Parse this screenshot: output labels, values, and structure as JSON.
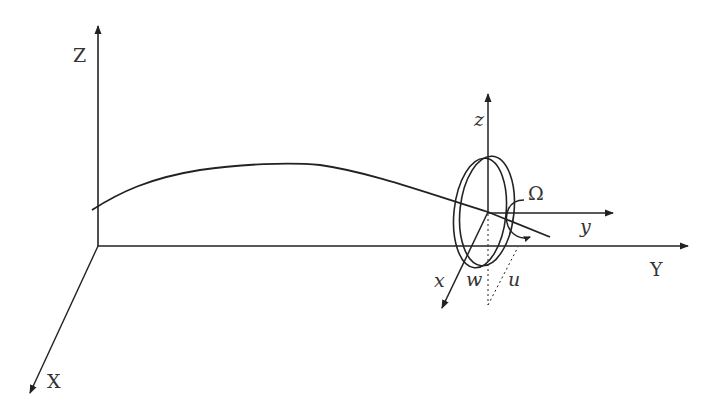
{
  "diagram": {
    "type": "3D coordinate schematic of rotating disk on a curved shaft",
    "colors": {
      "stroke": "#222222",
      "label": "#333333",
      "background": "#ffffff"
    },
    "global_axes": {
      "Z": {
        "label": "Z"
      },
      "Y": {
        "label": "Y"
      },
      "X": {
        "label": "X"
      }
    },
    "local_axes": {
      "z": {
        "label": "z"
      },
      "y": {
        "label": "y"
      },
      "x": {
        "label": "x"
      }
    },
    "displacements": {
      "w": {
        "label": "w"
      },
      "u": {
        "label": "u"
      }
    },
    "rotation": {
      "label": "Ω"
    },
    "elements": [
      "global-axes",
      "deflected-shaft-curve",
      "disk",
      "local-axes",
      "rotation-arrow",
      "dotted-projection-lines"
    ]
  }
}
